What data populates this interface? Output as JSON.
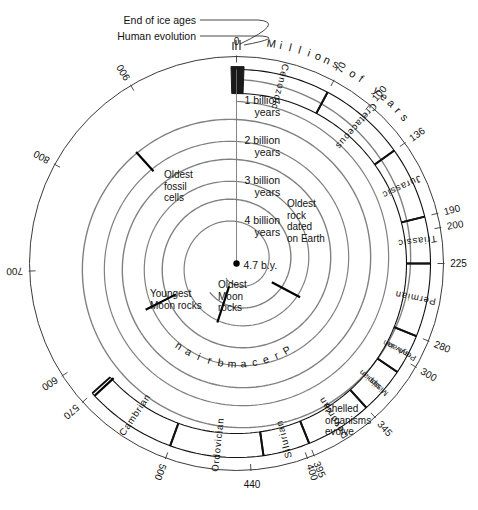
{
  "figure": {
    "type": "geologic-time-spiral",
    "units_label": "Millions of years",
    "zero_label": "0",
    "center_label": "4.7 b.y.",
    "precambrian_label": "Precambrian",
    "colors": {
      "outer_line": "#3a3a3a",
      "spiral_line": "#808080",
      "era_line": "#111111",
      "text": "#111111",
      "precambrian_text": "#9a9a9a",
      "quaternary_fill": "#1a1a1a",
      "background": "#ffffff"
    }
  },
  "callouts": [
    {
      "name": "end-of-ice-ages",
      "text": "End of ice ages"
    },
    {
      "name": "human-evolution",
      "text": "Human evolution"
    }
  ],
  "billion_year_labels": [
    {
      "line1": "1 billion",
      "line2": "years"
    },
    {
      "line1": "2 billion",
      "line2": "years"
    },
    {
      "line1": "3 billion",
      "line2": "years"
    },
    {
      "line1": "4 billion",
      "line2": "years"
    }
  ],
  "event_labels": [
    {
      "name": "oldest-fossil-cells",
      "lines": [
        "Oldest",
        "fossil",
        "cells"
      ]
    },
    {
      "name": "oldest-rock-dated-on-earth",
      "lines": [
        "Oldest",
        "rock",
        "dated",
        "on Earth"
      ]
    },
    {
      "name": "youngest-moon-rocks",
      "lines": [
        "Youngest",
        "Moon rocks"
      ]
    },
    {
      "name": "oldest-moon-rocks",
      "lines": [
        "Oldest",
        "Moon",
        "rocks"
      ]
    },
    {
      "name": "shelled-organisms-evolve",
      "lines": [
        "Shelled",
        "organisms",
        "evolve"
      ]
    }
  ],
  "periods": [
    {
      "name": "cenozoic",
      "label": "Cenozoic",
      "start_ma": 0,
      "end_ma": 70,
      "two_line": false
    },
    {
      "name": "cretaceous",
      "label": "Cretaceous",
      "start_ma": 70,
      "end_ma": 136,
      "two_line": false
    },
    {
      "name": "jurassic",
      "label": "Jurassic",
      "start_ma": 136,
      "end_ma": 190,
      "two_line": false
    },
    {
      "name": "triassic",
      "label": "Triassic",
      "start_ma": 190,
      "end_ma": 225,
      "two_line": false
    },
    {
      "name": "permian",
      "label": "Permian",
      "start_ma": 225,
      "end_ma": 280,
      "two_line": false
    },
    {
      "name": "pennsylvanian",
      "label": "Penn-|sylvan-|ian",
      "start_ma": 280,
      "end_ma": 310,
      "two_line": true
    },
    {
      "name": "mississippian",
      "label": "Missis-|sippian",
      "start_ma": 310,
      "end_ma": 345,
      "two_line": true
    },
    {
      "name": "devonian",
      "label": "Devonian",
      "start_ma": 345,
      "end_ma": 395,
      "two_line": false
    },
    {
      "name": "silurian",
      "label": "Silurian",
      "start_ma": 395,
      "end_ma": 430,
      "two_line": false
    },
    {
      "name": "ordovician",
      "label": "Ordovician",
      "start_ma": 430,
      "end_ma": 500,
      "two_line": false
    },
    {
      "name": "cambrian",
      "label": "Cambrian",
      "start_ma": 500,
      "end_ma": 570,
      "two_line": false
    }
  ],
  "tick_labels": [
    {
      "value": "0",
      "ma": 0
    },
    {
      "value": "70",
      "ma": 70
    },
    {
      "value": "100",
      "ma": 100
    },
    {
      "value": "136",
      "ma": 136
    },
    {
      "value": "190",
      "ma": 190
    },
    {
      "value": "200",
      "ma": 200
    },
    {
      "value": "225",
      "ma": 225
    },
    {
      "value": "280",
      "ma": 280
    },
    {
      "value": "300",
      "ma": 300
    },
    {
      "value": "345",
      "ma": 345
    },
    {
      "value": "395",
      "ma": 395
    },
    {
      "value": "400",
      "ma": 400
    },
    {
      "value": "440",
      "ma": 440
    },
    {
      "value": "500",
      "ma": 500
    },
    {
      "value": "570",
      "ma": 570
    },
    {
      "value": "600",
      "ma": 600
    },
    {
      "value": "700",
      "ma": 700
    },
    {
      "value": "800",
      "ma": 800
    },
    {
      "value": "900",
      "ma": 900
    }
  ],
  "chart_data": {
    "type": "spiral-timeline",
    "xlabel": "Millions of years",
    "center_age_by": 4.7,
    "outer_scale_ticks": [
      0,
      70,
      100,
      136,
      190,
      200,
      225,
      280,
      300,
      345,
      395,
      400,
      440,
      500,
      570,
      600,
      700,
      800,
      900
    ],
    "spiral_turn_ages_billion_years": [
      1,
      2,
      3,
      4
    ],
    "eras": [
      "Cenozoic",
      "Mesozoic",
      "Paleozoic",
      "Precambrian"
    ]
  }
}
